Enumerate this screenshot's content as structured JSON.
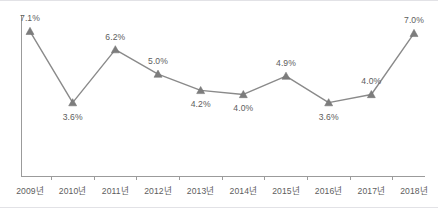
{
  "chart_data": {
    "type": "line",
    "title": "",
    "subtitle": "",
    "xlabel": "",
    "ylabel": "",
    "categories": [
      "2009년",
      "2010년",
      "2011년",
      "2012년",
      "2013년",
      "2014년",
      "2015년",
      "2016년",
      "2017년",
      "2018년"
    ],
    "values": [
      7.1,
      3.6,
      6.2,
      5.0,
      4.2,
      4.0,
      4.9,
      3.6,
      4.0,
      7.0
    ],
    "point_labels": [
      "7.1%",
      "3.6%",
      "6.2%",
      "5.0%",
      "4.2%",
      "4.0%",
      "4.9%",
      "3.6%",
      "4.0%",
      "7.0%"
    ],
    "label_positions": [
      "above",
      "below",
      "above",
      "above",
      "below",
      "below",
      "above",
      "below",
      "above",
      "above"
    ],
    "ylim": [
      0,
      7.9
    ],
    "yticks_visible": false,
    "grid": false,
    "legend": false,
    "legend_position": "none",
    "marker": "triangle",
    "series": [
      {
        "name": "증가율",
        "values": [
          7.1,
          3.6,
          6.2,
          5.0,
          4.2,
          4.0,
          4.9,
          3.6,
          4.0,
          7.0
        ]
      }
    ],
    "colors": {
      "line": "#8a8a8a",
      "marker": "#7d7d7d",
      "axis": "#9b9b9b",
      "text": "#5d5d5d",
      "frame": "#e2e2e6",
      "background": "#ffffff"
    }
  }
}
